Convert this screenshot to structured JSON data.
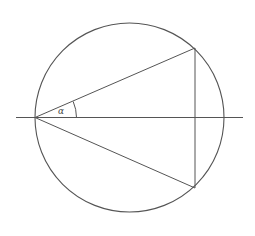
{
  "figure": {
    "name": "inscribed-angle-circle-diagram",
    "canvas": {
      "width": 255,
      "height": 236,
      "background": "#ffffff"
    },
    "stroke_color": "#555555",
    "circle": {
      "name": "circle",
      "cx": 129.5,
      "cy": 117.5,
      "r": 94.5,
      "stroke_width": 1.1
    },
    "horizontal_line": {
      "name": "horizontal-diameter-line",
      "x1": 16,
      "y1": 117.5,
      "x2": 243,
      "y2": 117.5,
      "stroke_width": 1.0
    },
    "vertex": {
      "name": "angle-vertex",
      "x": 35,
      "y": 117.5
    },
    "upper_point": {
      "name": "upper-chord-endpoint",
      "x": 195,
      "y": 48
    },
    "lower_point": {
      "name": "lower-chord-endpoint",
      "x": 195,
      "y": 188
    },
    "chords": [
      {
        "name": "upper-chord",
        "x1": 35,
        "y1": 117.5,
        "x2": 195,
        "y2": 48,
        "stroke_width": 1.0
      },
      {
        "name": "lower-chord",
        "x1": 35,
        "y1": 117.5,
        "x2": 195,
        "y2": 188,
        "stroke_width": 1.0
      },
      {
        "name": "vertical-chord",
        "x1": 195,
        "y1": 48,
        "x2": 195,
        "y2": 188,
        "stroke_width": 1.0
      }
    ],
    "angle_arc": {
      "name": "angle-arc",
      "path": "M 76.5 117.5 A 41.5 41.5 0 0 0 73.2 101.5",
      "stroke_width": 1.0
    },
    "angle_label": {
      "name": "angle-label-alpha",
      "text": "α",
      "x": 58,
      "y": 107
    }
  }
}
